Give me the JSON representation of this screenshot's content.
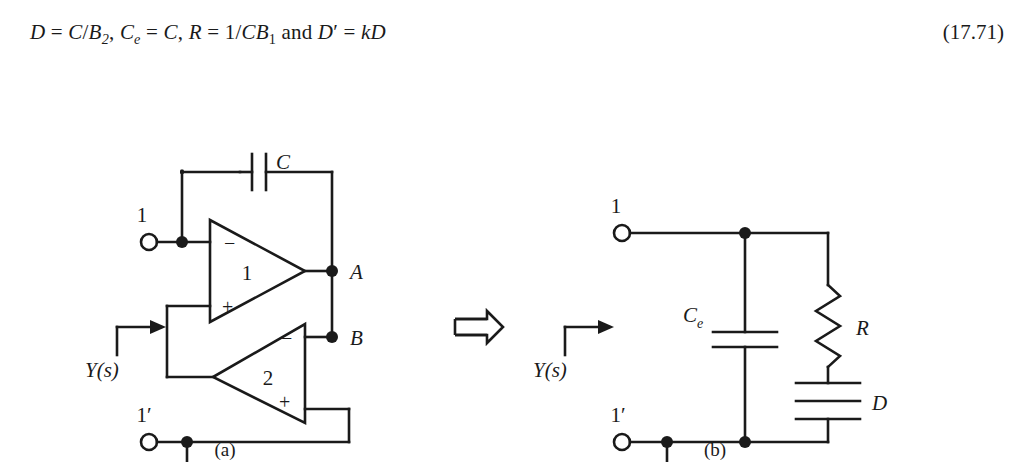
{
  "equation": {
    "text_segments": [
      {
        "t": "D",
        "style": "italic"
      },
      {
        "t": " = ",
        "style": "normal"
      },
      {
        "t": "C/B",
        "style": "italic"
      },
      {
        "t": "2",
        "style": "sub-italic"
      },
      {
        "t": ", ",
        "style": "normal"
      },
      {
        "t": "C",
        "style": "italic"
      },
      {
        "t": "e",
        "style": "sub-italic"
      },
      {
        "t": " = ",
        "style": "normal"
      },
      {
        "t": "C",
        "style": "italic"
      },
      {
        "t": ", ",
        "style": "normal"
      },
      {
        "t": "R",
        "style": "italic"
      },
      {
        "t": " = 1/",
        "style": "normal"
      },
      {
        "t": "CB",
        "style": "italic"
      },
      {
        "t": "1",
        "style": "sub-italic"
      },
      {
        "t": " and ",
        "style": "normal"
      },
      {
        "t": "D",
        "style": "italic"
      },
      {
        "t": "′",
        "style": "normal"
      },
      {
        "t": " = ",
        "style": "normal"
      },
      {
        "t": "kD",
        "style": "italic"
      }
    ],
    "plain": "D = C/B2, Ce = C, R = 1/CB1 and D′ = kD",
    "number": "(17.71)"
  },
  "transform_symbol": "⇒",
  "circuit_a": {
    "caption": "(a)",
    "source_label": "Y(s)",
    "terminal_top": "1",
    "terminal_bottom": "1′",
    "capacitor_label": "C",
    "opamp1_label": "1",
    "opamp2_label": "2",
    "opamp1_inv": "−",
    "opamp1_noninv": "+",
    "opamp2_inv": "−",
    "opamp2_noninv": "+",
    "node_a_label": "A",
    "node_b_label": "B"
  },
  "circuit_b": {
    "caption": "(b)",
    "source_label": "Y(s)",
    "terminal_top": "1",
    "terminal_bottom": "1′",
    "capacitor_ce_label": "C",
    "capacitor_ce_sub": "e",
    "resistor_label": "R",
    "element_d_label": "D"
  },
  "colors": {
    "line": "#1a1a1a",
    "background": "#ffffff",
    "text": "#1a1a1a"
  }
}
